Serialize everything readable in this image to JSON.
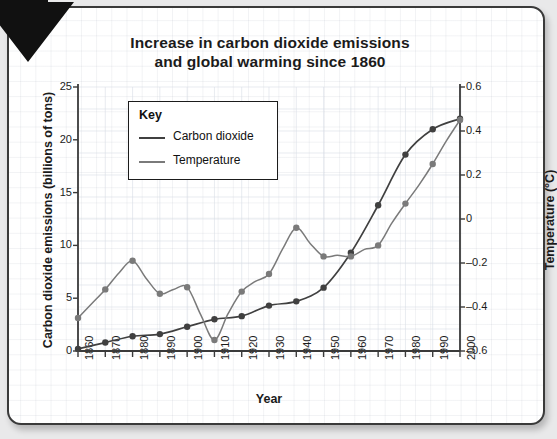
{
  "card": {
    "decor_icon": "down-left-arrow-icon"
  },
  "chart_data": {
    "type": "line",
    "title": "Increase in carbon dioxide emissions and global warming since 1860",
    "title_line1": "Increase in carbon dioxide emissions",
    "title_line2": "and global warming since 1860",
    "xlabel": "Year",
    "ylabel": "Carbon dioxide emissions (billions of tons)",
    "ylabel_right": "Temperature (°C)",
    "grid": true,
    "legend_position": "upper-left-inside",
    "legend_title": "Key",
    "x": [
      1860,
      1870,
      1880,
      1890,
      1900,
      1910,
      1920,
      1930,
      1940,
      1950,
      1960,
      1970,
      1980,
      1990,
      2000
    ],
    "xlim": [
      1860,
      2000
    ],
    "xticks": [
      "1860",
      "1870",
      "1880",
      "1890",
      "1900",
      "1910",
      "1920",
      "1930",
      "1940",
      "1950",
      "1960",
      "1970",
      "1980",
      "1990",
      "2000"
    ],
    "ylim": [
      0,
      25
    ],
    "yticks": [
      "0",
      "5",
      "10",
      "15",
      "20",
      "25"
    ],
    "ylim_right": [
      -0.6,
      0.6
    ],
    "yticks_right": [
      "-0.6",
      "-0.4",
      "-0.2",
      "0",
      "0.2",
      "0.4",
      "0.6"
    ],
    "series": [
      {
        "name": "Carbon dioxide",
        "axis": "left",
        "color": "#404040",
        "unit": "billions of tons",
        "values": [
          0.2,
          0.8,
          1.4,
          1.6,
          2.3,
          3.0,
          3.3,
          4.3,
          4.7,
          6.0,
          9.3,
          13.8,
          18.6,
          21.0,
          22.0
        ]
      },
      {
        "name": "Temperature",
        "axis": "right",
        "color": "#7a7a7a",
        "unit": "°C",
        "values": [
          -0.45,
          -0.32,
          -0.19,
          -0.34,
          -0.31,
          -0.55,
          -0.33,
          -0.25,
          -0.04,
          -0.17,
          -0.17,
          -0.12,
          0.07,
          0.25,
          0.45
        ]
      }
    ]
  }
}
